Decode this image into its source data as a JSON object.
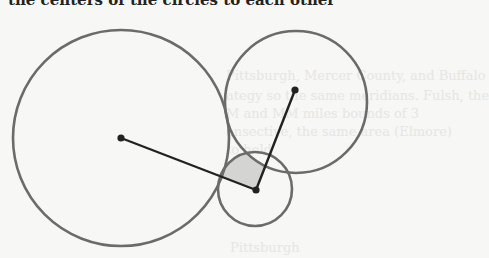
{
  "caption": "the centers of the circles to each other",
  "ghost_text": [
    {
      "text": "Pittsburgh, Mercer County, and Buffalo",
      "x": 226,
      "y": 80
    },
    {
      "text": "ategy so the same meridians. Fulsh, the",
      "x": 226,
      "y": 100
    },
    {
      "text": "M and MM miles bounds of 3",
      "x": 226,
      "y": 118
    },
    {
      "text": "onsective, the same area (Elmore)",
      "x": 226,
      "y": 136
    },
    {
      "text": "to hold",
      "x": 226,
      "y": 154
    },
    {
      "text": "Pittsburgh",
      "x": 230,
      "y": 252
    }
  ],
  "diagram": {
    "circles": [
      {
        "name": "large-left-circle",
        "cx": 121,
        "cy": 138,
        "r": 108
      },
      {
        "name": "upper-right-circle",
        "cx": 296,
        "cy": 102,
        "r": 71
      },
      {
        "name": "small-bottom-circle",
        "cx": 255,
        "cy": 189,
        "r": 37
      }
    ],
    "center_point": {
      "x": 256,
      "y": 190
    },
    "radii_lines": [
      {
        "from": [
          256,
          190
        ],
        "to": [
          121,
          138
        ]
      },
      {
        "from": [
          256,
          190
        ],
        "to": [
          295,
          90
        ]
      }
    ],
    "shaded_region_color": "#d4d4d2",
    "stroke_color": "#6b6b6b",
    "line_color": "#222222"
  }
}
